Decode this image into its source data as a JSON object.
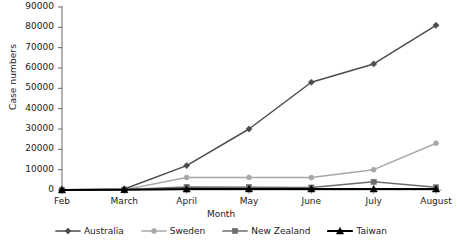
{
  "chart_data": {
    "type": "line",
    "title": "",
    "xlabel": "Month",
    "ylabel": "Case numbers",
    "categories": [
      "Feb",
      "March",
      "April",
      "May",
      "June",
      "July",
      "August"
    ],
    "ylim": [
      0,
      90000
    ],
    "ytick_step": 10000,
    "yticks": [
      "0",
      "10000",
      "20000",
      "30000",
      "40000",
      "50000",
      "60000",
      "70000",
      "80000",
      "90000"
    ],
    "grid": false,
    "legend_position": "bottom",
    "series": [
      {
        "name": "Australia",
        "marker": "diamond",
        "color": "#4d4d4d",
        "values": [
          100,
          500,
          12000,
          30000,
          53000,
          62000,
          81000
        ]
      },
      {
        "name": "Sweden",
        "marker": "circle",
        "color": "#a8a8a8",
        "values": [
          0,
          100,
          6200,
          6200,
          6100,
          10000,
          23000
        ]
      },
      {
        "name": "New Zealand",
        "marker": "square",
        "color": "#6e6e6e",
        "values": [
          60,
          200,
          1500,
          1400,
          1200,
          4000,
          1300
        ]
      },
      {
        "name": "Taiwan",
        "marker": "triangle",
        "color": "#000000",
        "values": [
          30,
          150,
          450,
          500,
          500,
          500,
          500
        ]
      }
    ]
  },
  "axis": {
    "y_label": "Case numbers",
    "x_label": "Month"
  }
}
